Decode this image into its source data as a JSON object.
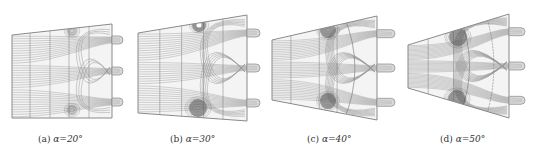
{
  "figure": {
    "panels": [
      {
        "id": "a",
        "label": "(a)",
        "angle_text": "α=20°",
        "caption_x": 38,
        "geometry": {
          "left": 12,
          "left_top": 35,
          "left_bottom": 118,
          "right": 112,
          "right_top": 24,
          "right_bottom": 118,
          "nozzle_end": 123
        },
        "vortices": [
          {
            "cx": 72,
            "cy": 31,
            "r": 5
          },
          {
            "cx": 72,
            "cy": 110,
            "r": 5
          }
        ]
      },
      {
        "id": "b",
        "label": "(b)",
        "angle_text": "α=30°",
        "caption_x": 170,
        "geometry": {
          "left": 138,
          "left_top": 33,
          "left_bottom": 113,
          "right": 247,
          "right_top": 15,
          "right_bottom": 121,
          "nozzle_end": 260
        },
        "vortices": [
          {
            "cx": 199,
            "cy": 25,
            "r": 7
          },
          {
            "cx": 198,
            "cy": 108,
            "r": 9
          }
        ]
      },
      {
        "id": "c",
        "label": "(c)",
        "angle_text": "α=40°",
        "caption_x": 307,
        "geometry": {
          "left": 272,
          "left_top": 40,
          "left_bottom": 100,
          "right": 377,
          "right_top": 16,
          "right_bottom": 120,
          "nozzle_end": 395
        },
        "vortices": [
          {
            "cx": 328,
            "cy": 30,
            "r": 8
          },
          {
            "cx": 328,
            "cy": 101,
            "r": 8
          }
        ]
      },
      {
        "id": "d",
        "label": "(d)",
        "angle_text": "α=50°",
        "caption_x": 440,
        "geometry": {
          "left": 408,
          "left_top": 45,
          "left_bottom": 88,
          "right": 509,
          "right_top": 14,
          "right_bottom": 118,
          "nozzle_end": 525
        },
        "vortices": [
          {
            "cx": 458,
            "cy": 37,
            "r": 9
          },
          {
            "cx": 457,
            "cy": 99,
            "r": 9
          }
        ]
      }
    ],
    "colors": {
      "outline": "#8a8a8a",
      "streamline": "#9a9a9a",
      "vortex": "#5a5a5a",
      "section_line": "#777777",
      "nozzle_fill": "#d8d8d8"
    }
  }
}
